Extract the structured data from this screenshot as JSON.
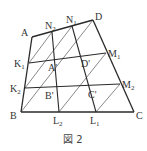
{
  "figure": {
    "caption": "図 2",
    "colors": {
      "line": "#2a2a2a",
      "label": "#333333"
    }
  },
  "points": [
    {
      "id": "A",
      "base": "A",
      "sub": "",
      "prime": false
    },
    {
      "id": "N2",
      "base": "N",
      "sub": "2",
      "prime": false
    },
    {
      "id": "N1",
      "base": "N",
      "sub": "1",
      "prime": false
    },
    {
      "id": "D",
      "base": "D",
      "sub": "",
      "prime": false
    },
    {
      "id": "K1",
      "base": "K",
      "sub": "1",
      "prime": false
    },
    {
      "id": "Ap",
      "base": "A'",
      "sub": "",
      "prime": true
    },
    {
      "id": "Dp",
      "base": "D'",
      "sub": "",
      "prime": true
    },
    {
      "id": "M1",
      "base": "M",
      "sub": "1",
      "prime": false
    },
    {
      "id": "K2",
      "base": "K",
      "sub": "2",
      "prime": false
    },
    {
      "id": "Bp",
      "base": "B'",
      "sub": "",
      "prime": true
    },
    {
      "id": "Cp",
      "base": "C'",
      "sub": "",
      "prime": true
    },
    {
      "id": "M2",
      "base": "M",
      "sub": "2",
      "prime": false
    },
    {
      "id": "B",
      "base": "B",
      "sub": "",
      "prime": false
    },
    {
      "id": "L2",
      "base": "L",
      "sub": "2",
      "prime": false
    },
    {
      "id": "L1",
      "base": "L",
      "sub": "1",
      "prime": false
    },
    {
      "id": "C",
      "base": "C",
      "sub": "",
      "prime": false
    }
  ],
  "segments": {
    "outline": [
      "A-D",
      "D-C",
      "C-B",
      "B-A"
    ],
    "grid": [
      "K1-M1",
      "K2-M2",
      "N2-L2",
      "N1-L1"
    ],
    "diagonals": [
      "K1-N2",
      "K2-N1",
      "B-D",
      "L2-M1",
      "L1-M2"
    ]
  }
}
